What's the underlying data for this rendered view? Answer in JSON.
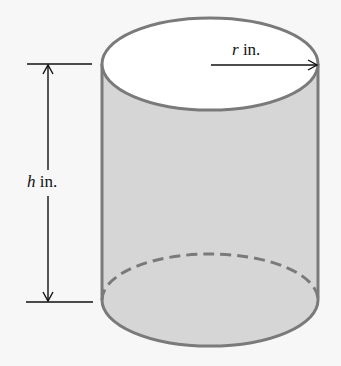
{
  "figure": {
    "type": "cylinder",
    "radius_label": {
      "var": "r",
      "unit": " in."
    },
    "height_label": {
      "var": "h",
      "unit": " in."
    },
    "colors": {
      "side_fill": "#d6d6d6",
      "top_fill": "#ffffff",
      "outline": "#7a7a7a",
      "dimension_lines": "#111111",
      "background": "#f7f7f7"
    }
  }
}
